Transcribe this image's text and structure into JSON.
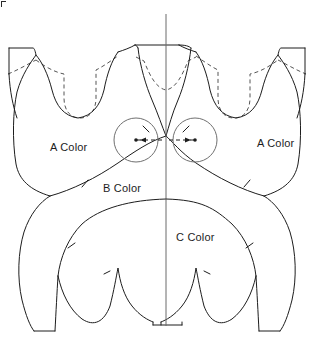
{
  "figure": {
    "kind": "garment-pattern-diagram",
    "width_px": 314,
    "height_px": 348,
    "background_color": "#ffffff",
    "line_color": "#1d1d1d",
    "hidden_line_color": "#555555",
    "center_line_color": "#6b6b6b",
    "circle_color": "#707070"
  },
  "labels": {
    "a_color_left": "A Color",
    "a_color_right": "A Color",
    "b_color": "B Color",
    "c_color": "C Color"
  },
  "construction": {
    "center_line": {
      "x": 166,
      "y_top": 14,
      "y_bottom": 326
    },
    "circles": [
      {
        "id": "left-circle",
        "cx": 136,
        "cy": 140,
        "r": 22
      },
      {
        "id": "right-circle",
        "cx": 195,
        "cy": 140,
        "r": 22
      }
    ],
    "dimension_line": {
      "from_x": 133,
      "to_x": 198,
      "y": 140,
      "style": "dashed-double-arrow"
    }
  },
  "notches": [
    {
      "id": "notch-b-left",
      "x": 85,
      "y": 183
    },
    {
      "id": "notch-b-right",
      "x": 248,
      "y": 183
    },
    {
      "id": "notch-c-left",
      "x": 72,
      "y": 245
    },
    {
      "id": "notch-c-right",
      "x": 258,
      "y": 245
    },
    {
      "id": "notch-center-left",
      "x": 146,
      "y": 129
    },
    {
      "id": "notch-center-right",
      "x": 186,
      "y": 129
    }
  ]
}
